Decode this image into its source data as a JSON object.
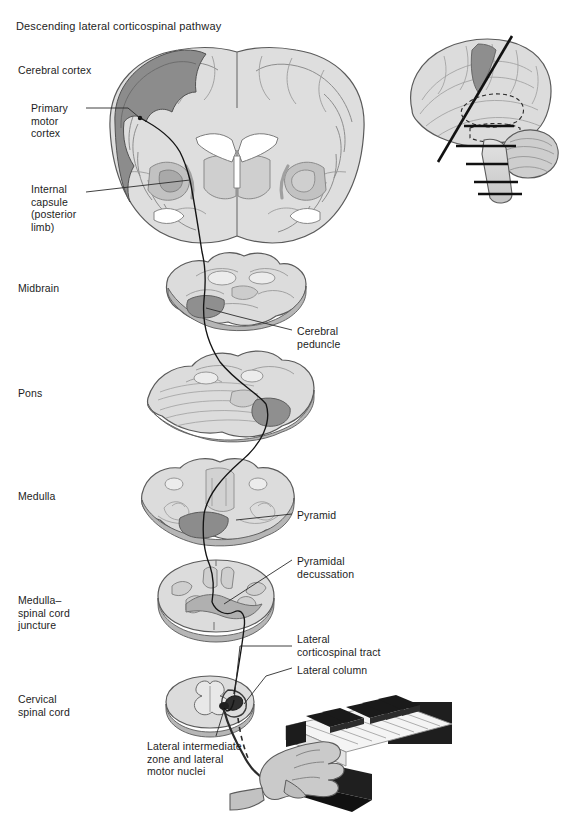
{
  "figure": {
    "title": "Descending lateral corticospinal pathway",
    "type": "anatomical-diagram",
    "subject": "lateral corticospinal tract",
    "colors": {
      "background": "#ffffff",
      "text": "#1d1d1d",
      "outline": "#4a4a4a",
      "parenchyma_light": "#dcdcdc",
      "parenchyma_mid": "#c8c8c8",
      "gray_matter": "#9a9a9a",
      "motor_cortex_ribbon": "#8a8a8a",
      "highlight_tract": "#8f8f8f",
      "ventricle_white": "#ffffff",
      "pathway_line": "#1a1a1a",
      "piano_black_key": "#1c1c1c",
      "piano_white_key": "#f2f2f2",
      "hand_skin": "#c9c9c9"
    }
  },
  "left_labels": [
    {
      "id": "cerebral-cortex",
      "text": "Cerebral cortex",
      "x": 18,
      "y": 64
    },
    {
      "id": "primary-motor-cortex",
      "text": "Primary\nmotor\ncortex",
      "x": 31,
      "y": 102
    },
    {
      "id": "internal-capsule",
      "text": "Internal\ncapsule\n(posterior\nlimb)",
      "x": 31,
      "y": 183
    },
    {
      "id": "midbrain",
      "text": "Midbrain",
      "x": 18,
      "y": 282
    },
    {
      "id": "pons",
      "text": "Pons",
      "x": 18,
      "y": 387
    },
    {
      "id": "medulla",
      "text": "Medulla",
      "x": 18,
      "y": 490
    },
    {
      "id": "medulla-spinal-cord-juncture",
      "text": "Medulla–\nspinal cord\njuncture",
      "x": 18,
      "y": 594
    },
    {
      "id": "cervical-spinal-cord",
      "text": "Cervical\nspinal cord",
      "x": 18,
      "y": 693
    }
  ],
  "right_labels": [
    {
      "id": "cerebral-peduncle",
      "text": "Cerebral\npeduncle",
      "x": 295,
      "y": 325
    },
    {
      "id": "pyramid",
      "text": "Pyramid",
      "x": 295,
      "y": 509
    },
    {
      "id": "pyramidal-decussation",
      "text": "Pyramidal\ndecussation",
      "x": 295,
      "y": 556
    },
    {
      "id": "lateral-corticospinal-tract",
      "text": "Lateral\ncorticospinal tract",
      "x": 295,
      "y": 634
    },
    {
      "id": "lateral-column",
      "text": "Lateral column",
      "x": 295,
      "y": 665
    }
  ],
  "bottom_labels": [
    {
      "id": "lateral-intermediate-zone",
      "text": "Lateral intermediate\nzone and lateral\nmotor nuclei",
      "x": 147,
      "y": 740
    }
  ],
  "inset": {
    "id": "lateral-brain-inset",
    "description": "lateral view of brain with coronal section plane and brainstem section levels",
    "x": 398,
    "y": 26,
    "width": 158,
    "height": 170
  },
  "sections": [
    {
      "id": "coronal-cerebrum-section",
      "label_ref": "cerebral-cortex",
      "cx": 237,
      "cy": 150
    },
    {
      "id": "midbrain-section",
      "label_ref": "midbrain",
      "cx": 220,
      "cy": 292
    },
    {
      "id": "pons-section",
      "label_ref": "pons",
      "cx": 222,
      "cy": 397
    },
    {
      "id": "medulla-section",
      "label_ref": "medulla",
      "cx": 218,
      "cy": 500
    },
    {
      "id": "medulla-spinal-juncture-section",
      "label_ref": "medulla-spinal-cord-juncture",
      "cx": 215,
      "cy": 602
    },
    {
      "id": "cervical-cord-section",
      "label_ref": "cervical-spinal-cord",
      "cx": 210,
      "cy": 706
    }
  ],
  "illustration": {
    "id": "hand-on-piano",
    "description": "hand playing piano keyboard, target of corticospinal output",
    "x": 262,
    "y": 700
  }
}
